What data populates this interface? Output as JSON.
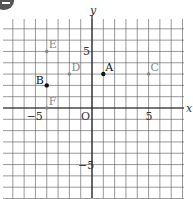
{
  "badge": {
    "icon": "notebook-icon"
  },
  "chart_data": {
    "type": "scatter",
    "title": "",
    "xlabel": "x",
    "ylabel": "y",
    "origin_label": "O",
    "xlim": [
      -8,
      8
    ],
    "ylim": [
      -8,
      8
    ],
    "grid": true,
    "x_ticks": [
      {
        "value": -5,
        "label": "−5"
      },
      {
        "value": 5,
        "label": "5"
      }
    ],
    "y_ticks": [
      {
        "value": 5,
        "label": "5"
      },
      {
        "value": -5,
        "label": "−5"
      }
    ],
    "points": [
      {
        "label": "A",
        "x": 1,
        "y": 3,
        "style": "dark"
      },
      {
        "label": "B",
        "x": -4,
        "y": 2,
        "style": "dark"
      },
      {
        "label": "C",
        "x": 5,
        "y": 3,
        "style": "light"
      },
      {
        "label": "D",
        "x": -2,
        "y": 3,
        "style": "light"
      },
      {
        "label": "E",
        "x": -4,
        "y": 5,
        "style": "light"
      },
      {
        "label": "F",
        "x": -4,
        "y": 0,
        "style": "light"
      }
    ],
    "colors": {
      "dark": "#111111",
      "light": "#888888",
      "grid": "#555555",
      "axis": "#222222"
    }
  }
}
